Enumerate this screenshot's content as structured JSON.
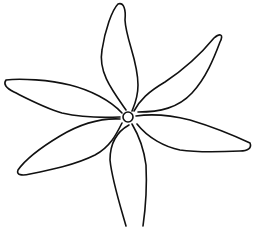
{
  "figure": {
    "description": "Line drawing of a six-petaled flower",
    "petal_count": 6,
    "stroke_color": "#111111",
    "background_color": "#ffffff",
    "center": {
      "x": 128,
      "y": 117,
      "r": 5
    }
  }
}
